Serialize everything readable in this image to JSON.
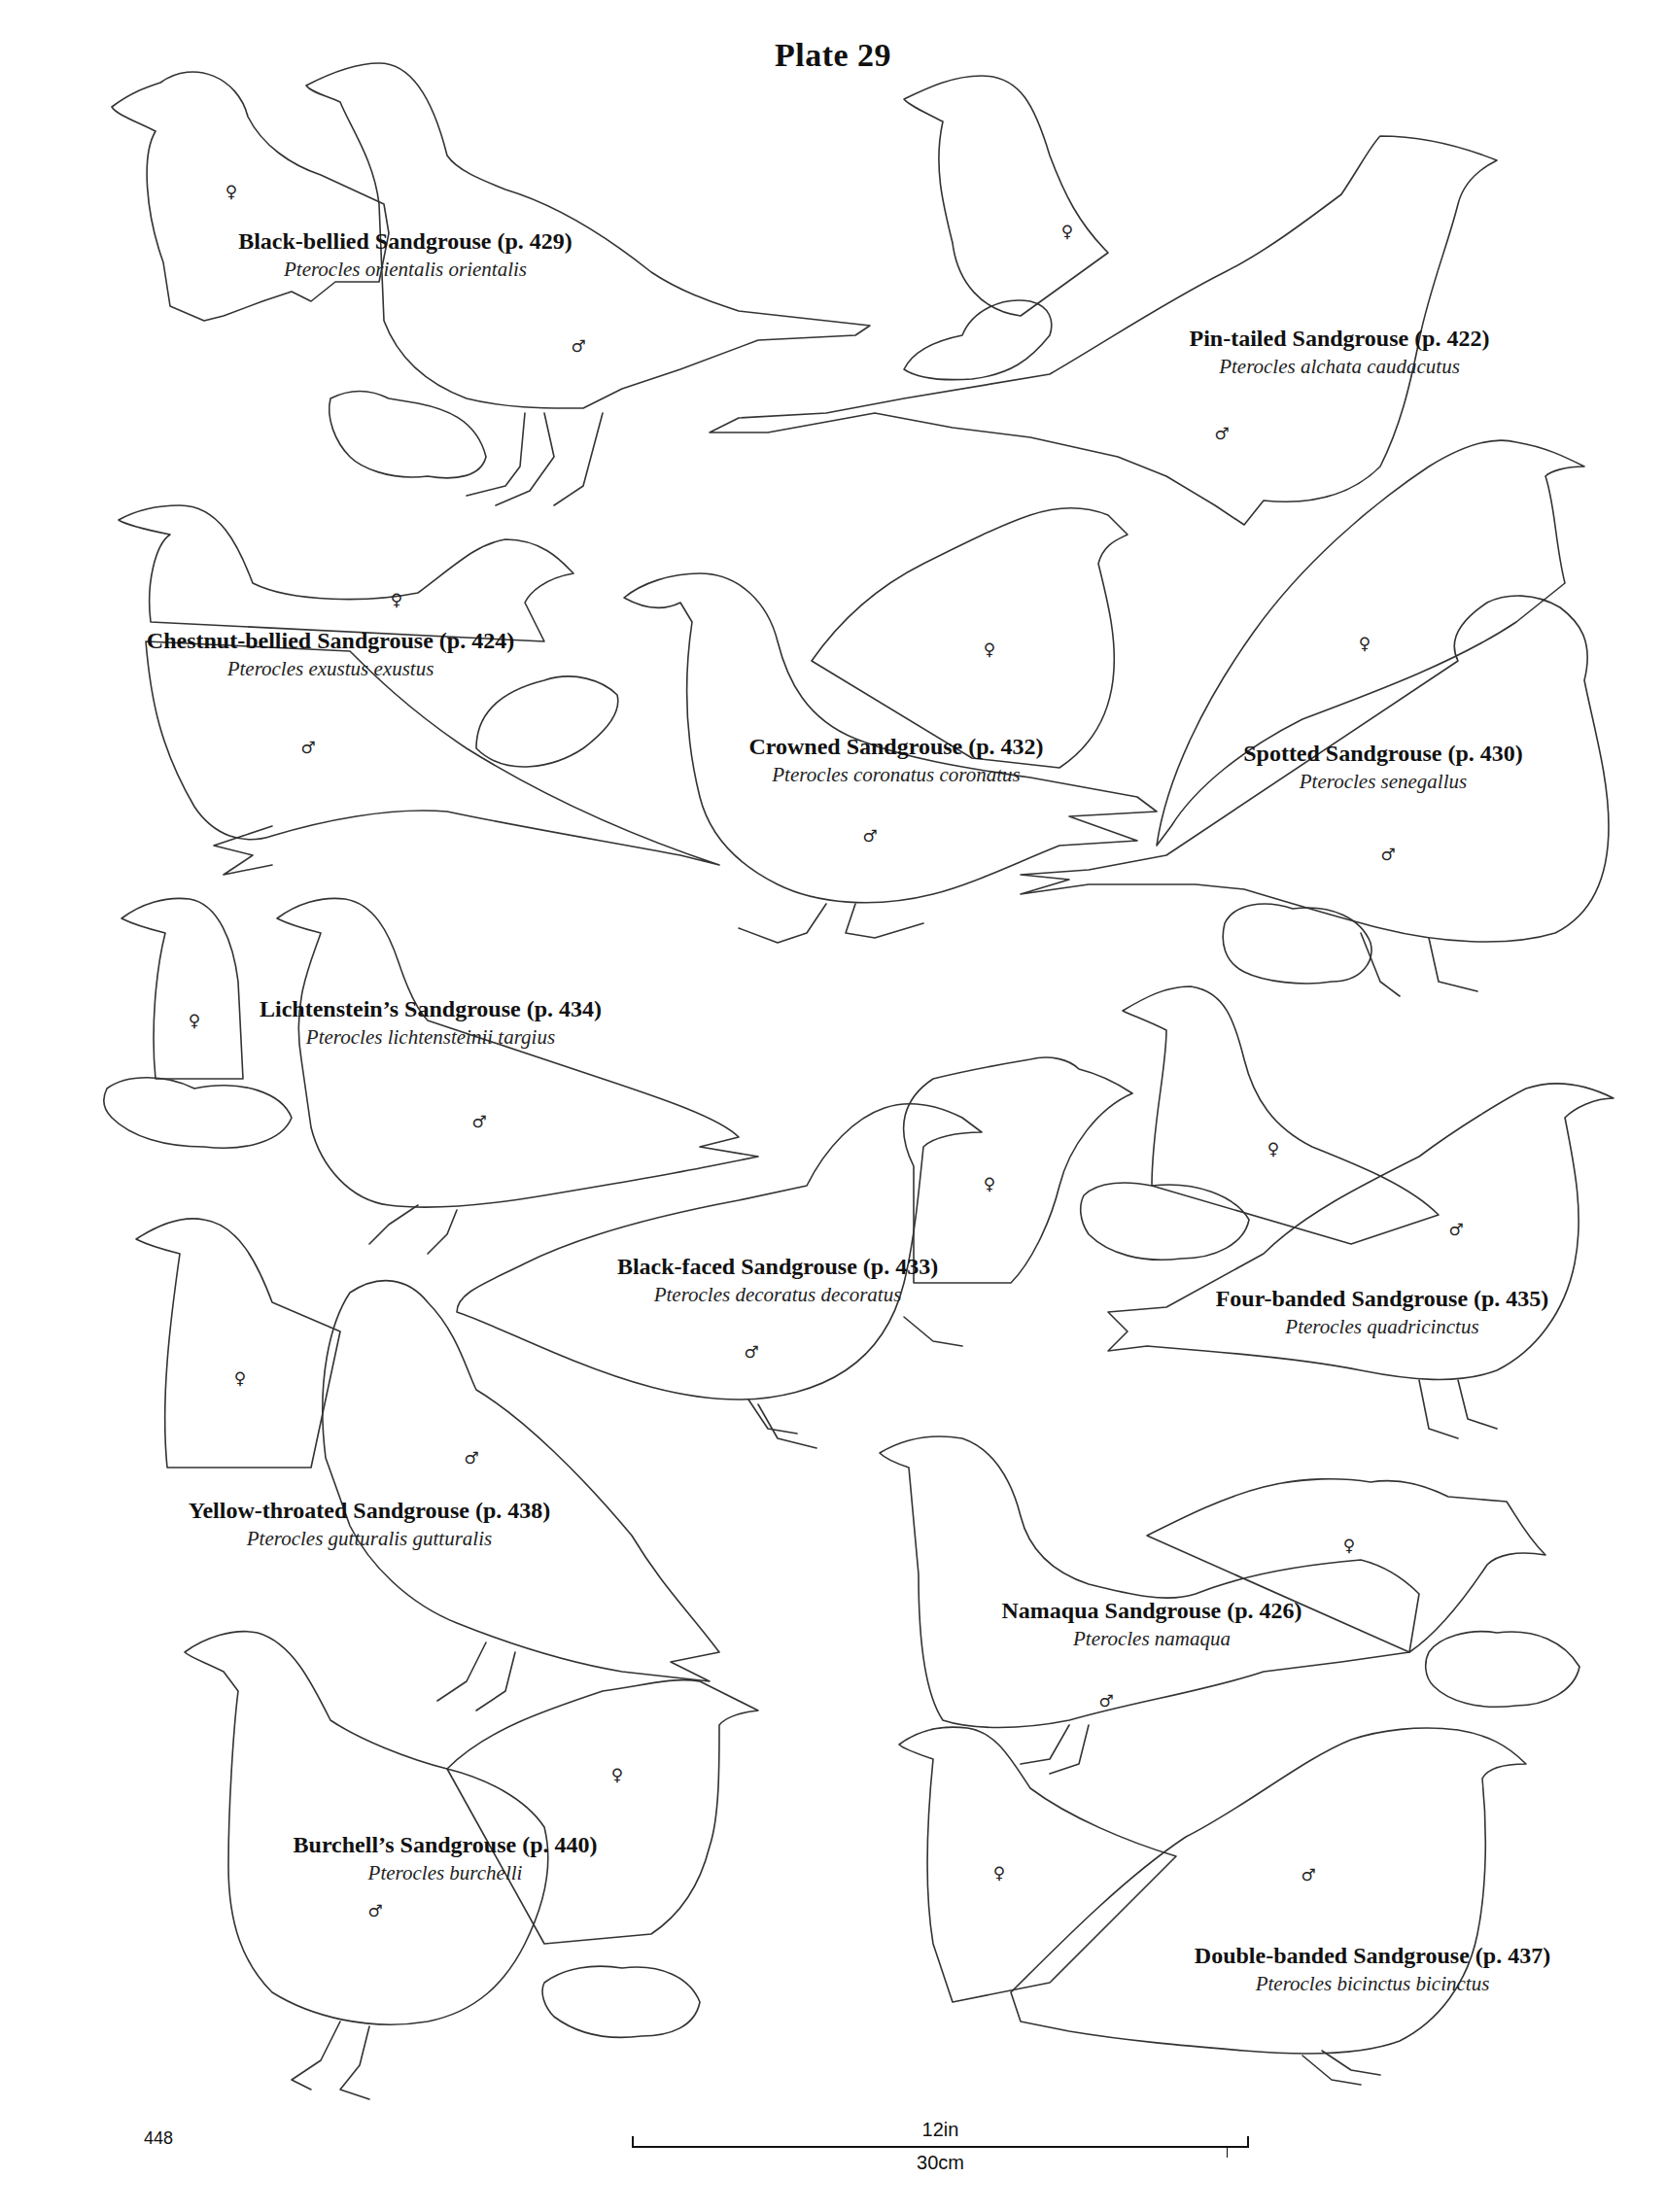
{
  "plate": {
    "title": "Plate 29",
    "page_number": "448"
  },
  "scale_bar": {
    "imperial": "12in",
    "metric": "30cm"
  },
  "species": [
    {
      "common": "Black-bellied Sandgrouse (p. 429)",
      "scientific": "Pterocles orientalis orientalis"
    },
    {
      "common": "Pin-tailed Sandgrouse (p. 422)",
      "scientific": "Pterocles alchata caudacutus"
    },
    {
      "common": "Chestnut-bellied Sandgrouse (p. 424)",
      "scientific": "Pterocles exustus exustus"
    },
    {
      "common": "Crowned Sandgrouse (p. 432)",
      "scientific": "Pterocles coronatus coronatus"
    },
    {
      "common": "Spotted Sandgrouse (p. 430)",
      "scientific": "Pterocles senegallus"
    },
    {
      "common": "Lichtenstein’s Sandgrouse (p. 434)",
      "scientific": "Pterocles lichtensteinii targius"
    },
    {
      "common": "Black-faced Sandgrouse (p. 433)",
      "scientific": "Pterocles decoratus decoratus"
    },
    {
      "common": "Four-banded Sandgrouse (p. 435)",
      "scientific": "Pterocles quadricinctus"
    },
    {
      "common": "Yellow-throated Sandgrouse (p. 438)",
      "scientific": "Pterocles gutturalis gutturalis"
    },
    {
      "common": "Namaqua Sandgrouse (p. 426)",
      "scientific": "Pterocles namaqua"
    },
    {
      "common": "Burchell’s Sandgrouse (p. 440)",
      "scientific": "Pterocles burchelli"
    },
    {
      "common": "Double-banded Sandgrouse (p. 437)",
      "scientific": "Pterocles bicinctus bicinctus"
    }
  ],
  "symbols": {
    "female": "♀",
    "male": "♂"
  }
}
